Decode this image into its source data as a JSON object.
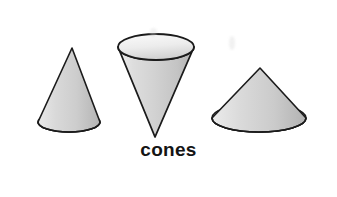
{
  "figure": {
    "title": "cones",
    "caption": "cones",
    "background_color": "#ffffff",
    "frame": {
      "border_color": "#2f2f33",
      "border_width_px": 2,
      "x": 21,
      "y": 14,
      "width": 304,
      "height": 169
    },
    "palette": {
      "outline": "#1b1b1b",
      "fill_light": "#f2f2f2",
      "fill_mid": "#d6d6d6",
      "fill_dark": "#b8b8b8",
      "ellipse_face_light": "#f7f7f7",
      "ellipse_face_dark": "#c9c9c9",
      "caption_color": "#141414"
    },
    "shapes": [
      {
        "name": "cone-left",
        "label": "cone pointing up (narrow)",
        "orientation": "apex-up",
        "apex": {
          "x": 72,
          "y": 48
        },
        "base_center": {
          "x": 69,
          "y": 122
        },
        "base_radius_x": 31,
        "base_radius_y": 10
      },
      {
        "name": "cone-middle",
        "label": "cone pointing down (inverted)",
        "orientation": "apex-down",
        "apex": {
          "x": 155,
          "y": 137
        },
        "base_center": {
          "x": 156,
          "y": 47
        },
        "base_radius_x": 38,
        "base_radius_y": 13
      },
      {
        "name": "cone-right",
        "label": "cone pointing up (wide)",
        "orientation": "apex-up",
        "apex": {
          "x": 260,
          "y": 68
        },
        "base_center": {
          "x": 259,
          "y": 118
        },
        "base_radius_x": 47,
        "base_radius_y": 14
      }
    ],
    "artifacts": [
      {
        "name": "scan-smudge-upper",
        "x": 150,
        "y": 28,
        "width": 7,
        "height": 9
      },
      {
        "name": "scan-smudge-right",
        "x": 229,
        "y": 36,
        "width": 6,
        "height": 14
      }
    ]
  }
}
